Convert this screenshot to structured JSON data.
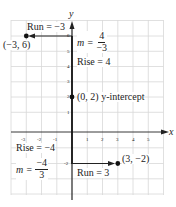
{
  "axes": {
    "x_label": "x",
    "y_label": "y"
  },
  "x_ticks": [
    "-3",
    "-2",
    "-1",
    "1",
    "2",
    "3",
    "4",
    "5"
  ],
  "y_ticks": [
    "6",
    "5",
    "4",
    "3",
    "2",
    "1",
    "-2"
  ],
  "points": [
    {
      "label": "(−3, 6)"
    },
    {
      "label": "(0, 2) y-intercept"
    },
    {
      "label": "(3, −2)"
    }
  ],
  "annotations": {
    "run_neg": "Run = −3",
    "rise_pos": "Rise = 4",
    "m1_prefix": "m =",
    "m1_num": "4",
    "m1_den": "−3",
    "rise_neg": "Rise = −4",
    "m2_prefix": "m =",
    "m2_num": "−4",
    "m2_den": "3",
    "run_pos": "Run = 3"
  },
  "colors": {
    "grid": "#d8d8d8",
    "axis": "#222222",
    "point": "#111111"
  }
}
